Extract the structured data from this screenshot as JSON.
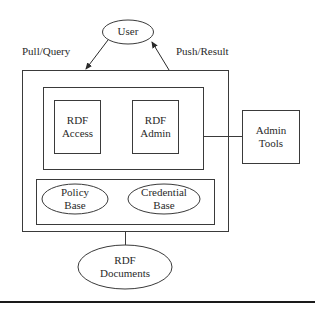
{
  "diagram": {
    "nodes": {
      "user": {
        "label": "User",
        "shape": "ellipse"
      },
      "rdf_access": {
        "line1": "RDF",
        "line2": "Access",
        "shape": "rectangle"
      },
      "rdf_admin": {
        "line1": "RDF",
        "line2": "Admin",
        "shape": "rectangle"
      },
      "admin_tools": {
        "line1": "Admin",
        "line2": "Tools",
        "shape": "rectangle"
      },
      "policy_base": {
        "line1": "Policy",
        "line2": "Base",
        "shape": "ellipse"
      },
      "credential_base": {
        "line1": "Credential",
        "line2": "Base",
        "shape": "ellipse"
      },
      "rdf_documents": {
        "line1": "RDF",
        "line2": "Documents",
        "shape": "ellipse"
      }
    },
    "edges": {
      "pull_query": {
        "label": "Pull/Query",
        "from": "User",
        "to": "System"
      },
      "push_result": {
        "label": "Push/Result",
        "from": "System",
        "to": "User"
      },
      "admin_link": {
        "from": "RDF Admin group",
        "to": "Admin Tools"
      },
      "docs_link": {
        "from": "System",
        "to": "RDF Documents"
      }
    },
    "colors": {
      "stroke": "#3a3a3a",
      "text": "#2a2a2a",
      "background": "#ffffff"
    }
  }
}
